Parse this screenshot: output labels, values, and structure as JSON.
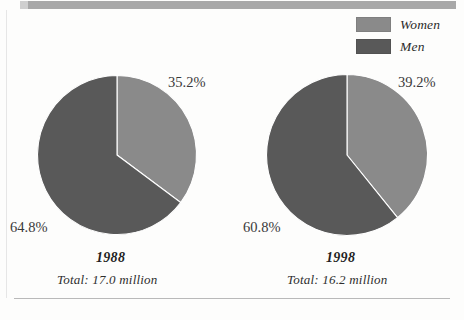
{
  "legend": {
    "items": [
      {
        "label": "Women",
        "color": "#8a8a8a",
        "swatch_name": "legend-swatch-women"
      },
      {
        "label": "Men",
        "color": "#595959",
        "swatch_name": "legend-swatch-men"
      }
    ]
  },
  "pies": [
    {
      "year": "1988",
      "total": "Total:  17.0 million",
      "women_pct": "35.2%",
      "men_pct": "64.8%"
    },
    {
      "year": "1998",
      "total": "Total:  16.2 million",
      "women_pct": "39.2%",
      "men_pct": "60.8%"
    }
  ],
  "chart_data": {
    "type": "pie",
    "title": "",
    "xlabel": "",
    "ylabel": "",
    "legend_position": "top-right",
    "grid": false,
    "colors": {
      "women": "#8a8a8a",
      "men": "#595959"
    },
    "charts": [
      {
        "name": "1988",
        "label": "1988",
        "total_label": "Total:  17.0 million",
        "total_value": 17.0,
        "total_units": "million",
        "categories": [
          "Women",
          "Men"
        ],
        "values": [
          35.2,
          64.8
        ],
        "value_labels": [
          "35.2%",
          "64.8%"
        ],
        "start_angle_deg": 0,
        "direction": "clockwise"
      },
      {
        "name": "1998",
        "label": "1998",
        "total_label": "Total:  16.2 million",
        "total_value": 16.2,
        "total_units": "million",
        "categories": [
          "Women",
          "Men"
        ],
        "values": [
          39.2,
          60.8
        ],
        "value_labels": [
          "39.2%",
          "60.8%"
        ],
        "start_angle_deg": 0,
        "direction": "clockwise"
      }
    ]
  }
}
